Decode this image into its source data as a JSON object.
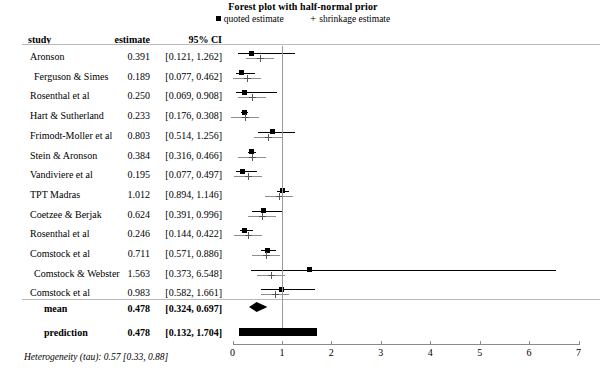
{
  "chart_data": {
    "type": "forest",
    "title": "Forest plot with half-normal prior",
    "xlabel": "",
    "ylabel": "",
    "xlim": [
      0,
      7
    ],
    "xticks": [
      0,
      1,
      2,
      3,
      4,
      5,
      6,
      7
    ],
    "xticklabels": [
      "0",
      "1",
      "2",
      "3",
      "4",
      "5",
      "6",
      "7"
    ],
    "reference_line": 1,
    "grid": false,
    "legend": {
      "position": "top-center",
      "entries": [
        {
          "marker": "filled-square",
          "label": "quoted estimate"
        },
        {
          "marker": "plus",
          "label": "shrinkage estimate"
        }
      ]
    },
    "columns": [
      "study",
      "estimate",
      "95% CI"
    ],
    "rows": [
      {
        "study": "Aronson",
        "estimate": 0.391,
        "ci_low": 0.121,
        "ci_high": 1.262,
        "estimate_text": "0.391",
        "ci_text": "[0.121, 1.262]",
        "shrinkage": 0.55
      },
      {
        "study": "Ferguson & Simes",
        "estimate": 0.189,
        "ci_low": 0.077,
        "ci_high": 0.462,
        "estimate_text": "0.189",
        "ci_text": "[0.077, 0.462]",
        "shrinkage": 0.3
      },
      {
        "study": "Rosenthal et al",
        "estimate": 0.25,
        "ci_low": 0.069,
        "ci_high": 0.908,
        "estimate_text": "0.250",
        "ci_text": "[0.069, 0.908]",
        "shrinkage": 0.4
      },
      {
        "study": "Hart & Sutherland",
        "estimate": 0.233,
        "ci_low": 0.176,
        "ci_high": 0.308,
        "estimate_text": "0.233",
        "ci_text": "[0.176, 0.308]",
        "shrinkage": 0.25
      },
      {
        "study": "Frimodt-Moller et al",
        "estimate": 0.803,
        "ci_low": 0.514,
        "ci_high": 1.256,
        "estimate_text": "0.803",
        "ci_text": "[0.514, 1.256]",
        "shrinkage": 0.72
      },
      {
        "study": "Stein & Aronson",
        "estimate": 0.384,
        "ci_low": 0.316,
        "ci_high": 0.466,
        "estimate_text": "0.384",
        "ci_text": "[0.316, 0.466]",
        "shrinkage": 0.39
      },
      {
        "study": "Vandiviere et al",
        "estimate": 0.195,
        "ci_low": 0.077,
        "ci_high": 0.497,
        "estimate_text": "0.195",
        "ci_text": "[0.077, 0.497]",
        "shrinkage": 0.31
      },
      {
        "study": "TPT Madras",
        "estimate": 1.012,
        "ci_low": 0.894,
        "ci_high": 1.146,
        "estimate_text": "1.012",
        "ci_text": "[0.894, 1.146]",
        "shrinkage": 0.95
      },
      {
        "study": "Coetzee & Berjak",
        "estimate": 0.624,
        "ci_low": 0.391,
        "ci_high": 0.996,
        "estimate_text": "0.624",
        "ci_text": "[0.391, 0.996]",
        "shrinkage": 0.6
      },
      {
        "study": "Rosenthal et al",
        "estimate": 0.246,
        "ci_low": 0.144,
        "ci_high": 0.422,
        "estimate_text": "0.246",
        "ci_text": "[0.144, 0.422]",
        "shrinkage": 0.31
      },
      {
        "study": "Comstock et al",
        "estimate": 0.711,
        "ci_low": 0.571,
        "ci_high": 0.886,
        "estimate_text": "0.711",
        "ci_text": "[0.571, 0.886]",
        "shrinkage": 0.68
      },
      {
        "study": "Comstock & Webster",
        "estimate": 1.563,
        "ci_low": 0.373,
        "ci_high": 6.548,
        "estimate_text": "1.563",
        "ci_text": "[0.373, 6.548]",
        "shrinkage": 0.78
      },
      {
        "study": "Comstock et al",
        "estimate": 0.983,
        "ci_low": 0.582,
        "ci_high": 1.661,
        "estimate_text": "0.983",
        "ci_text": "[0.582, 1.661]",
        "shrinkage": 0.86
      }
    ],
    "summary": [
      {
        "label": "mean",
        "estimate": 0.478,
        "ci_low": 0.324,
        "ci_high": 0.697,
        "estimate_text": "0.478",
        "ci_text": "[0.324, 0.697]",
        "shape": "diamond"
      },
      {
        "label": "prediction",
        "estimate": 0.478,
        "ci_low": 0.132,
        "ci_high": 1.704,
        "estimate_text": "0.478",
        "ci_text": "[0.132, 1.704]",
        "shape": "bar"
      }
    ],
    "footnote": "Heterogeneity (tau): 0.57 [0.33, 0.88]"
  }
}
